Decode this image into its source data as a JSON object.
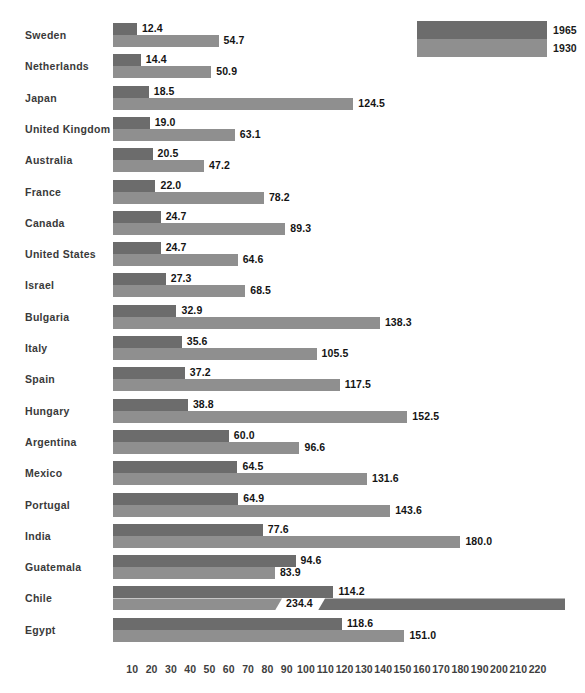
{
  "chart_data": {
    "type": "bar",
    "orientation": "horizontal",
    "title": "",
    "subtitle": "",
    "xlabel": "",
    "ylabel": "",
    "grid": false,
    "legend_position": "top-right",
    "xlim": [
      0,
      220
    ],
    "xticks": [
      10,
      20,
      30,
      40,
      50,
      60,
      70,
      80,
      90,
      100,
      110,
      120,
      130,
      140,
      150,
      160,
      170,
      180,
      190,
      200,
      210,
      220
    ],
    "xtick_labels": [
      "10",
      "20",
      "30",
      "40",
      "50",
      "60",
      "70",
      "80",
      "90",
      "100",
      "110",
      "120",
      "130",
      "140",
      "150",
      "160",
      "170",
      "180",
      "190",
      "200",
      "210",
      "220"
    ],
    "categories": [
      "Sweden",
      "Netherlands",
      "Japan",
      "United Kingdom",
      "Australia",
      "France",
      "Canada",
      "United States",
      "Israel",
      "Bulgaria",
      "Italy",
      "Spain",
      "Hungary",
      "Argentina",
      "Mexico",
      "Portugal",
      "India",
      "Guatemala",
      "Chile",
      "Egypt"
    ],
    "series": [
      {
        "name": "1965",
        "color": "#6c6c6c",
        "values": [
          12.4,
          14.4,
          18.5,
          19.0,
          20.5,
          22.0,
          24.7,
          24.7,
          27.3,
          32.9,
          35.6,
          37.2,
          38.8,
          60.0,
          64.5,
          64.9,
          77.6,
          94.6,
          114.2,
          118.6
        ],
        "labels": [
          "12.4",
          "14.4",
          "18.5",
          "19.0",
          "20.5",
          "22.0",
          "24.7",
          "24.7",
          "27.3",
          "32.9",
          "35.6",
          "37.2",
          "38.8",
          "60.0",
          "64.5",
          "64.9",
          "77.6",
          "94.6",
          "114.2",
          "118.6"
        ]
      },
      {
        "name": "1930",
        "color": "#8f8f8f",
        "values": [
          54.7,
          50.9,
          124.5,
          63.1,
          47.2,
          78.2,
          89.3,
          64.6,
          68.5,
          138.3,
          105.5,
          117.5,
          152.5,
          96.6,
          131.6,
          143.6,
          180.0,
          83.9,
          234.4,
          151.0
        ],
        "labels": [
          "54.7",
          "50.9",
          "124.5",
          "63.1",
          "47.2",
          "78.2",
          "89.3",
          "64.6",
          "68.5",
          "138.3",
          "105.5",
          "117.5",
          "152.5",
          "96.6",
          "131.6",
          "143.6",
          "180.0",
          "83.9",
          "234.4",
          "151.0"
        ],
        "broken_bars": [
          {
            "category": "Chile",
            "value": 234.4,
            "label": "234.4"
          }
        ]
      }
    ]
  },
  "legend": {
    "entries": [
      {
        "label": "1965",
        "color": "#6c6c6c",
        "name": "legend-swatch-1965"
      },
      {
        "label": "1930",
        "color": "#8f8f8f",
        "name": "legend-swatch-1930"
      }
    ]
  },
  "colors": {
    "series_1965": "#6c6c6c",
    "series_1930": "#8f8f8f",
    "break_tail": "#6e6e6e",
    "label_text": "#141414",
    "category_text": "#3a3a3a",
    "axis_text": "#3e3e3e",
    "background": "#ffffff"
  }
}
